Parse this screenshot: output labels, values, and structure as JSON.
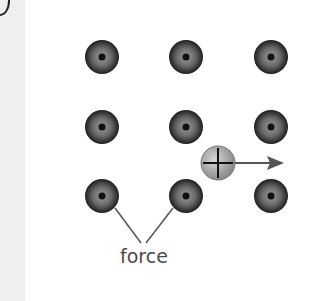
{
  "diagram": {
    "label": "force",
    "lattice_ions": [
      {
        "cx": 102,
        "cy": 57
      },
      {
        "cx": 186,
        "cy": 57
      },
      {
        "cx": 271,
        "cy": 57
      },
      {
        "cx": 102,
        "cy": 127
      },
      {
        "cx": 186,
        "cy": 127
      },
      {
        "cx": 271,
        "cy": 127
      },
      {
        "cx": 102,
        "cy": 196
      },
      {
        "cx": 186,
        "cy": 196
      },
      {
        "cx": 271,
        "cy": 196
      }
    ],
    "moving_charge": {
      "sign": "+",
      "cx": 218,
      "cy": 163
    },
    "arrow": {
      "direction": "right"
    },
    "colors": {
      "ion_dark": "#1e1e1e",
      "ion_light": "#8a8a8a",
      "charge": "#b0b0b0",
      "line": "#555555",
      "text": "#4a4a4a"
    }
  }
}
